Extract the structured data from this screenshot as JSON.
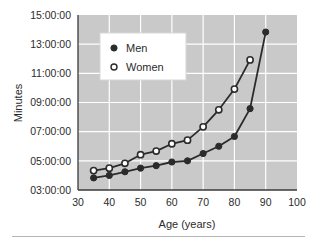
{
  "chart_data": {
    "type": "line",
    "title": "",
    "xlabel": "Age (years)",
    "ylabel": "Minutes",
    "xlim": [
      30,
      100
    ],
    "ylim": [
      3,
      15
    ],
    "xticks": [
      30,
      40,
      50,
      60,
      70,
      80,
      90,
      100
    ],
    "xticklabels": [
      "30",
      "40",
      "50",
      "60",
      "70",
      "80",
      "90",
      "100"
    ],
    "yticks": [
      3,
      5,
      7,
      9,
      11,
      13,
      15
    ],
    "yticklabels": [
      "03:00:00",
      "05:00:00",
      "07:00:00",
      "09:00:00",
      "11:00:00",
      "13:00:00",
      "15:00:00"
    ],
    "grid": true,
    "grid_color": "#ffffff",
    "plot_background": "#c9c9c9",
    "legend_position": "upper left",
    "series": [
      {
        "name": "Men",
        "marker": "filled-circle",
        "color": "#2b2b2b",
        "x": [
          35,
          40,
          45,
          50,
          55,
          60,
          65,
          70,
          75,
          80,
          85,
          90
        ],
        "y": [
          3.83,
          4.0,
          4.25,
          4.5,
          4.67,
          4.92,
          5.0,
          5.5,
          6.0,
          6.67,
          8.58,
          13.83
        ],
        "labels": [
          "03:50:00",
          "04:00:00",
          "04:15:00",
          "04:30:00",
          "04:40:00",
          "04:55:00",
          "05:00:00",
          "05:30:00",
          "06:00:00",
          "06:40:00",
          "08:35:00",
          "13:50:00"
        ]
      },
      {
        "name": "Women",
        "marker": "open-circle",
        "color": "#2b2b2b",
        "x": [
          35,
          40,
          45,
          50,
          55,
          60,
          65,
          70,
          75,
          80,
          85
        ],
        "y": [
          4.33,
          4.5,
          4.83,
          5.42,
          5.67,
          6.17,
          6.42,
          7.33,
          8.5,
          9.92,
          11.92
        ],
        "labels": [
          "04:20:00",
          "04:30:00",
          "04:50:00",
          "05:25:00",
          "05:40:00",
          "06:10:00",
          "06:25:00",
          "07:20:00",
          "08:30:00",
          "09:55:00",
          "11:55:00"
        ]
      }
    ]
  },
  "legend": {
    "entries": [
      {
        "label": "Men",
        "marker": "filled-circle"
      },
      {
        "label": "Women",
        "marker": "open-circle"
      }
    ]
  }
}
